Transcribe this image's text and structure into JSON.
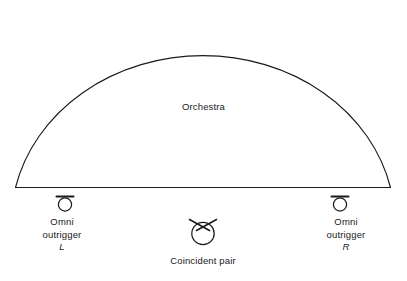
{
  "figure": {
    "type": "stage-microphone-placement-diagram",
    "background_color": "#ffffff",
    "line_color": "#1a1a1a",
    "text_color": "#1a1a1a"
  },
  "stage": {
    "orchestra_label": "Orchestra",
    "shape": "semicircular-stage-outline"
  },
  "microphones": [
    {
      "id": "omni-left",
      "icon": "omni-microphone-icon",
      "line1": "Omni",
      "line2": "outrigger",
      "channel": "L"
    },
    {
      "id": "coincident-pair",
      "icon": "coincident-pair-microphone-icon",
      "label": "Coincident pair"
    },
    {
      "id": "omni-right",
      "icon": "omni-microphone-icon",
      "line1": "Omni",
      "line2": "outrigger",
      "channel": "R"
    }
  ]
}
